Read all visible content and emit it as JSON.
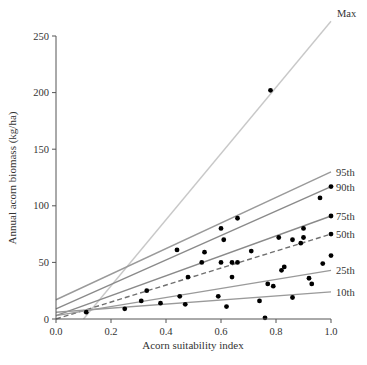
{
  "chart_data": {
    "type": "scatter",
    "title": "",
    "xlabel": "Acorn suitability index",
    "ylabel": "Annual acorn biomass (kg/ha)",
    "xlim": [
      0.0,
      1.0
    ],
    "ylim": [
      0,
      250
    ],
    "x_ticks": [
      "0.0",
      "0.2",
      "0.4",
      "0.6",
      "0.8",
      "1.0"
    ],
    "y_ticks": [
      "0",
      "50",
      "100",
      "150",
      "200",
      "250"
    ],
    "grid": false,
    "points": [
      {
        "x": 0.11,
        "y": 6
      },
      {
        "x": 0.25,
        "y": 9
      },
      {
        "x": 0.31,
        "y": 16
      },
      {
        "x": 0.33,
        "y": 25
      },
      {
        "x": 0.38,
        "y": 14
      },
      {
        "x": 0.44,
        "y": 61
      },
      {
        "x": 0.45,
        "y": 20
      },
      {
        "x": 0.47,
        "y": 13
      },
      {
        "x": 0.48,
        "y": 37
      },
      {
        "x": 0.53,
        "y": 50
      },
      {
        "x": 0.54,
        "y": 59
      },
      {
        "x": 0.59,
        "y": 20
      },
      {
        "x": 0.6,
        "y": 50
      },
      {
        "x": 0.6,
        "y": 80
      },
      {
        "x": 0.61,
        "y": 70
      },
      {
        "x": 0.62,
        "y": 11
      },
      {
        "x": 0.64,
        "y": 37
      },
      {
        "x": 0.64,
        "y": 50
      },
      {
        "x": 0.66,
        "y": 50
      },
      {
        "x": 0.66,
        "y": 89
      },
      {
        "x": 0.71,
        "y": 60
      },
      {
        "x": 0.74,
        "y": 16
      },
      {
        "x": 0.76,
        "y": 1
      },
      {
        "x": 0.77,
        "y": 31
      },
      {
        "x": 0.78,
        "y": 202
      },
      {
        "x": 0.79,
        "y": 29
      },
      {
        "x": 0.81,
        "y": 72
      },
      {
        "x": 0.82,
        "y": 43
      },
      {
        "x": 0.83,
        "y": 46
      },
      {
        "x": 0.86,
        "y": 19
      },
      {
        "x": 0.86,
        "y": 70
      },
      {
        "x": 0.89,
        "y": 67
      },
      {
        "x": 0.9,
        "y": 80
      },
      {
        "x": 0.9,
        "y": 72
      },
      {
        "x": 0.92,
        "y": 36
      },
      {
        "x": 0.93,
        "y": 31
      },
      {
        "x": 0.96,
        "y": 107
      },
      {
        "x": 0.97,
        "y": 49
      },
      {
        "x": 1.0,
        "y": 117
      },
      {
        "x": 1.0,
        "y": 91
      },
      {
        "x": 1.0,
        "y": 75
      },
      {
        "x": 1.0,
        "y": 56
      }
    ],
    "series": [
      {
        "name": "Max",
        "style": "solid",
        "color": "#c8c8c8",
        "x": [
          0.1,
          1.0
        ],
        "y": [
          0,
          263
        ]
      },
      {
        "name": "95th",
        "style": "solid",
        "color": "#9a9a9a",
        "x": [
          0.0,
          1.0
        ],
        "y": [
          17,
          130
        ]
      },
      {
        "name": "90th",
        "style": "solid",
        "color": "#8a8a8a",
        "x": [
          0.0,
          1.0
        ],
        "y": [
          9,
          117
        ]
      },
      {
        "name": "75th",
        "style": "solid",
        "color": "#8a8a8a",
        "x": [
          0.0,
          1.0
        ],
        "y": [
          3,
          91
        ]
      },
      {
        "name": "50th",
        "style": "dashed",
        "color": "#707070",
        "x": [
          0.0,
          1.0
        ],
        "y": [
          0,
          75
        ]
      },
      {
        "name": "25th",
        "style": "solid",
        "color": "#9a9a9a",
        "x": [
          0.0,
          1.0
        ],
        "y": [
          3,
          43
        ]
      },
      {
        "name": "10th",
        "style": "solid",
        "color": "#9a9a9a",
        "x": [
          0.0,
          1.0
        ],
        "y": [
          6,
          24
        ]
      }
    ]
  },
  "labels": {
    "xlabel": "Acorn suitability index",
    "ylabel": "Annual acorn biomass (kg/ha)"
  }
}
